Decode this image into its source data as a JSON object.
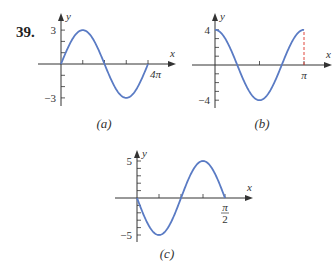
{
  "problem": {
    "number": "39."
  },
  "style": {
    "curve_color": "#5a7bc4",
    "axis_color": "#333333",
    "dashed_color": "#e0463c"
  },
  "chart_data": [
    {
      "id": "a",
      "type": "line",
      "caption": "(a)",
      "function": "y = 3 sin(x/2)",
      "xlabel": "x",
      "ylabel": "y",
      "xlim": [
        0,
        12.566
      ],
      "ylim": [
        -3,
        3
      ],
      "x_ticks": [
        {
          "value": 12.566,
          "label": "4π"
        }
      ],
      "x_tick_count": 4,
      "y_ticks": [
        {
          "value": 3,
          "label": "3"
        },
        {
          "value": -3,
          "label": "-3"
        }
      ],
      "y_minor_step": 1,
      "series": [
        {
          "name": "curve",
          "amplitude": 3,
          "period": 12.566,
          "phase": "sin",
          "sign": 1
        }
      ],
      "px": {
        "ox": 61,
        "oy": 64,
        "xEnd": 148,
        "yUnit": 11.3,
        "axisLeft": 38,
        "axisRight": 176,
        "axisTop": 13,
        "axisBottom": 106,
        "xtickCount": 4
      }
    },
    {
      "id": "b",
      "type": "line",
      "caption": "(b)",
      "function": "y = 4 cos(2x)",
      "xlabel": "x",
      "ylabel": "y",
      "xlim": [
        0,
        3.1416
      ],
      "ylim": [
        -4,
        4
      ],
      "x_ticks": [
        {
          "value": 3.1416,
          "label": "π"
        }
      ],
      "x_tick_count": 2,
      "y_ticks": [
        {
          "value": 4,
          "label": "4"
        },
        {
          "value": -4,
          "label": "-4"
        }
      ],
      "y_minor_step": 1,
      "annotations": [
        {
          "type": "dashed-vertical",
          "x": 3.1416,
          "from": 0,
          "to": 4
        }
      ],
      "series": [
        {
          "name": "curve",
          "amplitude": 4,
          "period": 3.1416,
          "phase": "cos",
          "sign": 1
        }
      ],
      "px": {
        "ox": 215,
        "oy": 65,
        "xEnd": 304,
        "yUnit": 8.8,
        "axisLeft": 192,
        "axisRight": 332,
        "axisTop": 13,
        "axisBottom": 108,
        "xtickCount": 2
      }
    },
    {
      "id": "c",
      "type": "line",
      "caption": "(c)",
      "function": "y = -5 sin(4x)",
      "xlabel": "x",
      "ylabel": "y",
      "xlim": [
        0,
        1.5708
      ],
      "ylim": [
        -5,
        5
      ],
      "x_ticks": [
        {
          "value": 1.5708,
          "label": "π/2"
        }
      ],
      "x_tick_count": 4,
      "y_ticks": [
        {
          "value": 5,
          "label": "5"
        },
        {
          "value": -5,
          "label": "-5"
        }
      ],
      "y_minor_step": 1,
      "series": [
        {
          "name": "curve",
          "amplitude": 5,
          "period": 1.5708,
          "phase": "sin",
          "sign": -1
        }
      ],
      "px": {
        "ox": 137,
        "oy": 198,
        "xEnd": 225,
        "yUnit": 7.4,
        "axisLeft": 115,
        "axisRight": 253,
        "axisTop": 150,
        "axisBottom": 242,
        "xtickCount": 4
      }
    }
  ]
}
